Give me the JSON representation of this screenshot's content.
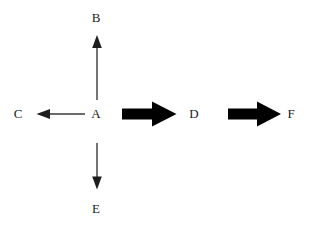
{
  "diagram": {
    "background_color": "#ffffff",
    "thin_arrow_color": "#3a3a3a",
    "bold_arrow_color": "#000000",
    "label_color": "#1a1a1a",
    "nodes": [
      {
        "id": "B",
        "label": "B",
        "x": 96,
        "y": 18
      },
      {
        "id": "C",
        "label": "C",
        "x": 18,
        "y": 114
      },
      {
        "id": "A",
        "label": "A",
        "x": 96,
        "y": 114
      },
      {
        "id": "D",
        "label": "D",
        "x": 194,
        "y": 114
      },
      {
        "id": "F",
        "label": "F",
        "x": 291,
        "y": 114
      },
      {
        "id": "E",
        "label": "E",
        "x": 96,
        "y": 209
      }
    ],
    "arrows": [
      {
        "name": "arrow-a-to-b",
        "from": "A",
        "to": "B",
        "direction": "up",
        "style": "thin",
        "x1": 97,
        "y1": 100,
        "x2": 97,
        "y2": 36
      },
      {
        "name": "arrow-a-to-c",
        "from": "A",
        "to": "C",
        "direction": "left",
        "style": "thin",
        "x1": 85,
        "y1": 114,
        "x2": 37,
        "y2": 114
      },
      {
        "name": "arrow-a-to-e",
        "from": "A",
        "to": "E",
        "direction": "down",
        "style": "thin",
        "x1": 97,
        "y1": 143,
        "x2": 97,
        "y2": 189
      },
      {
        "name": "arrow-a-to-d",
        "from": "A",
        "to": "D",
        "direction": "right",
        "style": "bold",
        "x1": 122,
        "y1": 114,
        "x2": 176,
        "y2": 114
      },
      {
        "name": "arrow-d-to-f",
        "from": "D",
        "to": "F",
        "direction": "right",
        "style": "bold",
        "x1": 228,
        "y1": 114,
        "x2": 281,
        "y2": 114
      }
    ]
  }
}
